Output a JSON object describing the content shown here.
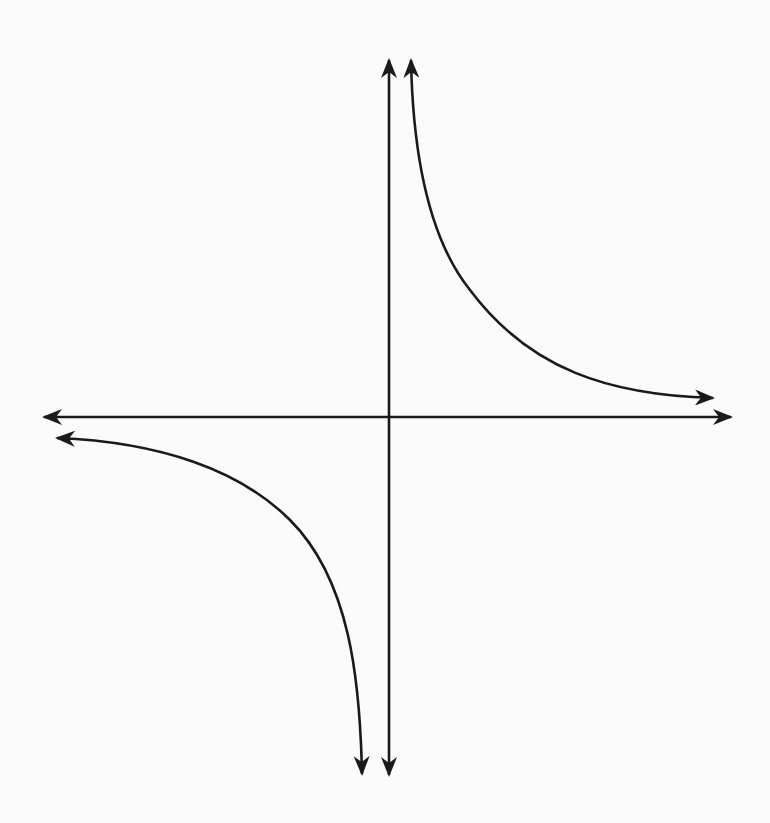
{
  "diagram": {
    "title": "",
    "colors": {
      "background": "#fbfbfb",
      "stroke": "#1a1a1a"
    },
    "origin": {
      "x": 389,
      "y": 417
    },
    "axes": {
      "x_axis": {
        "from": [
          42,
          417
        ],
        "to": [
          733,
          417
        ],
        "arrows": [
          "left",
          "right"
        ]
      },
      "y_axis": {
        "from": [
          389,
          58
        ],
        "to": [
          389,
          777
        ],
        "arrows": [
          "up",
          "down"
        ]
      }
    },
    "curves": [
      {
        "name": "quadrant-I-branch",
        "start_tip": [
          411,
          58
        ],
        "end_tip": [
          715,
          398
        ],
        "arrows": [
          "up",
          "right"
        ]
      },
      {
        "name": "quadrant-III-branch",
        "start_tip": [
          55,
          438
        ],
        "end_tip": [
          362,
          776
        ],
        "arrows": [
          "left",
          "down"
        ]
      }
    ],
    "labels": []
  }
}
